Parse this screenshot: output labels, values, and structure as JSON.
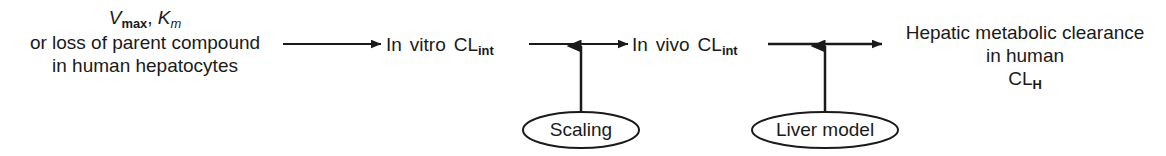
{
  "diagram": {
    "background_color": "#ffffff",
    "line_color": "#1a1a1a",
    "text_color": "#1a1a1a",
    "nodes": [
      {
        "id": "node-input",
        "line1_italic_v": "V",
        "line1_sub_max": "max",
        "line1_comma": ", ",
        "line1_italic_k": "K",
        "line1_sub_m": "m",
        "line2": "or loss of parent compound",
        "line3": "in human hepatocytes"
      },
      {
        "id": "node-in-vitro",
        "prefix": "In",
        "word": "vitro",
        "symbol": "CL",
        "subscript": "int"
      },
      {
        "id": "node-in-vivo",
        "prefix": "In",
        "word": "vivo",
        "symbol": "CL",
        "subscript": "int"
      },
      {
        "id": "node-output",
        "line1": "Hepatic metabolic clearance",
        "line2": "in human",
        "line3_symbol": "CL",
        "line3_subscript": "H"
      }
    ],
    "annotations": [
      {
        "id": "annotation-scaling",
        "label": "Scaling"
      },
      {
        "id": "annotation-liver-model",
        "label": "Liver model"
      }
    ],
    "arrows": [
      {
        "id": "arrow-1",
        "from": "node-input",
        "to": "node-in-vitro",
        "direction": "right"
      },
      {
        "id": "arrow-2",
        "from": "node-in-vitro",
        "to": "node-in-vivo",
        "direction": "right"
      },
      {
        "id": "arrow-3",
        "from": "node-in-vivo",
        "to": "node-output",
        "direction": "right"
      },
      {
        "id": "arrow-scaling",
        "from": "annotation-scaling",
        "to": "arrow-2",
        "direction": "up"
      },
      {
        "id": "arrow-liver-model",
        "from": "annotation-liver-model",
        "to": "arrow-3",
        "direction": "up"
      }
    ]
  }
}
